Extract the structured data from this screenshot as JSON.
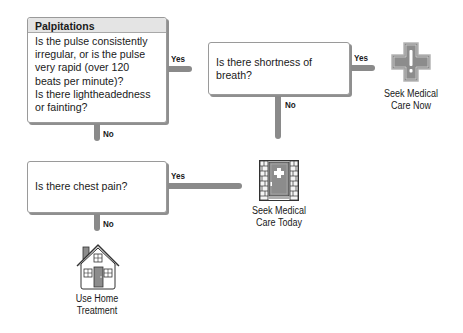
{
  "flowchart": {
    "start": {
      "title": "Palpitations",
      "question": "Is the pulse consistently irregular, or is the pulse very rapid (over 120 beats per minute)? Is there lightheadedness or fainting?",
      "question_lines": [
        "Is the pulse consistently",
        "irregular, or is the pulse",
        "very rapid (over 120",
        "beats per minute)?",
        "Is there lightheadedness",
        "or fainting?"
      ],
      "yes_label": "Yes",
      "no_label": "No"
    },
    "breath": {
      "question_lines": [
        "Is there shortness of",
        "breath?"
      ],
      "yes_label": "Yes",
      "no_label": "No"
    },
    "chest": {
      "question": "Is there chest pain?",
      "yes_label": "Yes",
      "no_label": "No"
    },
    "outcomes": {
      "care_now": {
        "lines": [
          "Seek Medical",
          "Care Now"
        ],
        "icon": "medical-cross-exclamation-icon"
      },
      "care_today": {
        "lines": [
          "Seek Medical",
          "Care Today"
        ],
        "icon": "clinic-door-icon"
      },
      "home": {
        "lines": [
          "Use Home",
          "Treatment"
        ],
        "icon": "house-icon"
      }
    }
  },
  "colors": {
    "arrow": "#8a8a8a",
    "icon_fill": "#8c8c8c",
    "header_bg": "#e4e4e4",
    "border": "#9a9a9a"
  }
}
